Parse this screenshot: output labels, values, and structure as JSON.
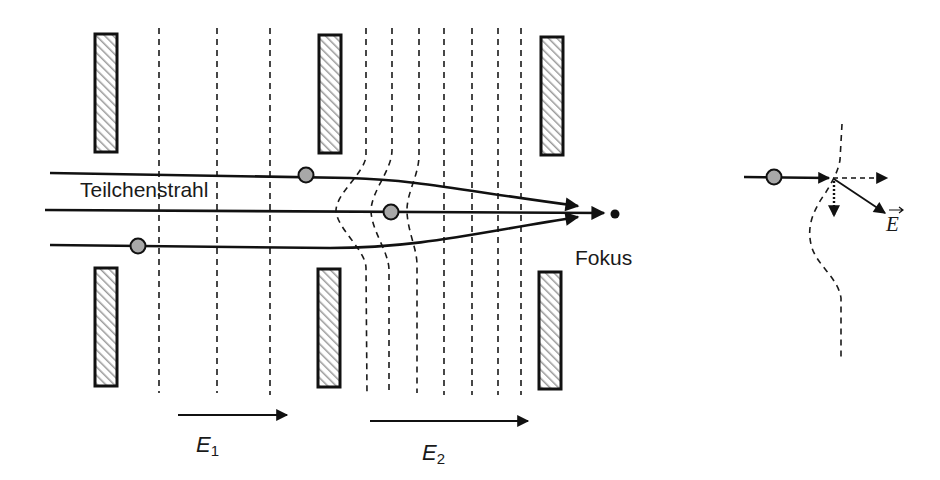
{
  "labels": {
    "beam": "Teilchenstrahl",
    "focus": "Fokus",
    "field1_letter": "E",
    "field1_sub": "1",
    "field2_letter": "E",
    "field2_sub": "2",
    "detail_field": "E"
  },
  "elements": {
    "electrodes": [
      {
        "id": "electrode-1-top",
        "group": "aperture-1",
        "side": "top"
      },
      {
        "id": "electrode-1-bottom",
        "group": "aperture-1",
        "side": "bottom"
      },
      {
        "id": "electrode-2-top",
        "group": "aperture-2",
        "side": "top"
      },
      {
        "id": "electrode-2-bottom",
        "group": "aperture-2",
        "side": "bottom"
      },
      {
        "id": "electrode-3-top",
        "group": "aperture-3",
        "side": "top"
      },
      {
        "id": "electrode-3-bottom",
        "group": "aperture-3",
        "side": "bottom"
      }
    ],
    "field_regions": [
      {
        "name": "E1",
        "line_count": 3,
        "shape": "straight"
      },
      {
        "name": "E2",
        "line_count": 7,
        "shape": "first three curved toward beam axis, rest straight"
      }
    ],
    "beams": [
      {
        "name": "upper-trajectory",
        "ends_at": "focus"
      },
      {
        "name": "axial-trajectory",
        "ends_at": "focus"
      },
      {
        "name": "lower-trajectory",
        "ends_at": "focus"
      }
    ],
    "particles": 3,
    "detail_vectors": [
      {
        "name": "field-vector",
        "style": "solid",
        "label": "E"
      },
      {
        "name": "horizontal-component",
        "style": "dashed"
      },
      {
        "name": "vertical-component",
        "style": "dotted"
      }
    ]
  },
  "colors": {
    "line": "#111111",
    "particle_fill": "#a8a8a8",
    "hatch": "#9a9a9a",
    "background": "#ffffff"
  }
}
